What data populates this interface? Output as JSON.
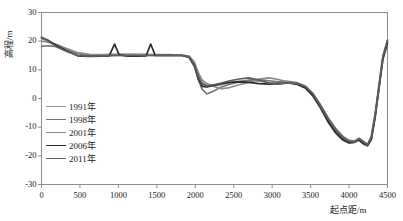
{
  "chart_data": {
    "type": "line",
    "title": "",
    "xlabel": "起点距/m",
    "ylabel": "高程/m",
    "xlim": [
      0,
      4500
    ],
    "ylim": [
      -30,
      30
    ],
    "xticks": [
      0,
      500,
      1000,
      1500,
      2000,
      2500,
      3000,
      3500,
      4000,
      4500
    ],
    "yticks": [
      30,
      20,
      10,
      0,
      -10,
      -20,
      -30
    ],
    "grid": false,
    "legend_position": "inside-left",
    "series": [
      {
        "name": "1991年",
        "color": "#9a9a9a",
        "width": 1.6,
        "x": [
          0,
          80,
          200,
          330,
          470,
          620,
          780,
          950,
          1120,
          1300,
          1480,
          1660,
          1830,
          1920,
          1990,
          2040,
          2090,
          2150,
          2240,
          2340,
          2450,
          2570,
          2700,
          2830,
          2960,
          3080,
          3200,
          3320,
          3430,
          3530,
          3630,
          3730,
          3830,
          3920,
          4000,
          4070,
          4130,
          4190,
          4240,
          4290,
          4340,
          4390,
          4440,
          4500
        ],
        "y": [
          20.8,
          20.0,
          18.6,
          17.2,
          15.9,
          15.3,
          15.2,
          15.3,
          15.4,
          15.3,
          15.2,
          15.2,
          15.1,
          14.6,
          12.0,
          8.0,
          5.6,
          4.6,
          4.4,
          4.8,
          5.6,
          6.1,
          6.2,
          6.0,
          5.6,
          5.4,
          5.6,
          5.2,
          4.0,
          1.2,
          -3.0,
          -7.8,
          -11.6,
          -14.0,
          -15.2,
          -15.0,
          -14.2,
          -15.6,
          -16.3,
          -14.0,
          -6.0,
          4.0,
          14.0,
          19.6
        ]
      },
      {
        "name": "1998年",
        "color": "#757575",
        "width": 1.6,
        "x": [
          0,
          80,
          200,
          330,
          470,
          620,
          780,
          950,
          1120,
          1300,
          1480,
          1660,
          1830,
          1920,
          1990,
          2040,
          2090,
          2150,
          2240,
          2340,
          2450,
          2570,
          2700,
          2830,
          2960,
          3080,
          3200,
          3320,
          3430,
          3530,
          3630,
          3730,
          3830,
          3920,
          4000,
          4070,
          4130,
          4190,
          4240,
          4290,
          4340,
          4390,
          4440,
          4500
        ],
        "y": [
          18.2,
          18.4,
          18.1,
          17.0,
          15.6,
          15.0,
          14.9,
          15.0,
          15.1,
          15.1,
          15.0,
          15.1,
          15.0,
          14.3,
          11.0,
          6.4,
          3.2,
          1.6,
          2.6,
          4.0,
          5.0,
          5.8,
          6.4,
          6.6,
          6.2,
          5.8,
          6.0,
          5.6,
          4.4,
          1.8,
          -2.2,
          -6.8,
          -10.6,
          -13.2,
          -14.6,
          -14.8,
          -13.8,
          -15.0,
          -16.0,
          -13.0,
          -5.0,
          5.0,
          15.0,
          20.2
        ]
      },
      {
        "name": "2001年",
        "color": "#8a8a8a",
        "width": 1.6,
        "x": [
          0,
          80,
          200,
          330,
          470,
          620,
          780,
          950,
          1120,
          1300,
          1480,
          1660,
          1830,
          1920,
          1990,
          2040,
          2090,
          2150,
          2240,
          2340,
          2450,
          2570,
          2700,
          2830,
          2960,
          3080,
          3200,
          3320,
          3430,
          3530,
          3630,
          3730,
          3830,
          3920,
          4000,
          4070,
          4130,
          4190,
          4240,
          4290,
          4340,
          4390,
          4440,
          4500
        ],
        "y": [
          20.0,
          19.6,
          18.8,
          17.4,
          16.0,
          15.4,
          15.3,
          15.4,
          15.4,
          15.4,
          15.3,
          15.3,
          15.2,
          14.8,
          12.6,
          9.0,
          6.4,
          5.2,
          4.2,
          3.4,
          3.8,
          4.8,
          5.6,
          6.8,
          7.2,
          6.6,
          5.8,
          5.0,
          3.6,
          0.8,
          -3.4,
          -8.4,
          -12.2,
          -14.6,
          -15.6,
          -15.4,
          -14.6,
          -16.0,
          -16.6,
          -14.4,
          -6.6,
          3.4,
          13.6,
          19.0
        ]
      },
      {
        "name": "2006年",
        "color": "#2b2b2b",
        "width": 1.7,
        "x": [
          0,
          80,
          200,
          330,
          470,
          620,
          780,
          880,
          950,
          1010,
          1120,
          1240,
          1360,
          1420,
          1480,
          1540,
          1660,
          1830,
          1920,
          1990,
          2040,
          2090,
          2150,
          2240,
          2340,
          2450,
          2570,
          2700,
          2830,
          2960,
          3080,
          3200,
          3320,
          3430,
          3530,
          3630,
          3730,
          3830,
          3920,
          4000,
          4070,
          4130,
          4190,
          4240,
          4290,
          4340,
          4390,
          4440,
          4500
        ],
        "y": [
          21.2,
          20.4,
          18.4,
          16.6,
          14.9,
          14.7,
          14.8,
          14.9,
          19.0,
          15.2,
          14.8,
          14.8,
          14.9,
          19.0,
          15.0,
          15.0,
          15.0,
          15.0,
          14.4,
          11.4,
          7.0,
          4.2,
          4.0,
          4.6,
          5.2,
          5.6,
          5.8,
          5.6,
          5.2,
          5.0,
          5.2,
          5.4,
          5.0,
          3.8,
          1.0,
          -3.2,
          -8.2,
          -12.0,
          -14.4,
          -15.4,
          -15.2,
          -14.4,
          -15.8,
          -16.4,
          -14.2,
          -6.2,
          3.8,
          13.8,
          19.4
        ]
      },
      {
        "name": "2011年",
        "color": "#5e5e5e",
        "width": 1.7,
        "x": [
          0,
          80,
          200,
          330,
          470,
          620,
          780,
          950,
          1120,
          1300,
          1480,
          1660,
          1830,
          1920,
          1990,
          2040,
          2090,
          2150,
          2240,
          2340,
          2450,
          2570,
          2700,
          2830,
          2960,
          3080,
          3200,
          3320,
          3430,
          3530,
          3630,
          3730,
          3830,
          3920,
          4000,
          4070,
          4130,
          4190,
          4240,
          4290,
          4340,
          4390,
          4440,
          4500
        ],
        "y": [
          21.4,
          20.2,
          18.0,
          16.4,
          15.0,
          14.8,
          14.9,
          15.0,
          15.0,
          15.0,
          15.0,
          15.1,
          15.0,
          14.5,
          11.8,
          7.6,
          5.0,
          4.4,
          4.8,
          5.4,
          6.2,
          6.8,
          7.2,
          6.4,
          5.4,
          5.0,
          5.4,
          5.2,
          4.2,
          1.6,
          -2.6,
          -7.2,
          -11.0,
          -13.6,
          -15.0,
          -15.2,
          -14.0,
          -15.2,
          -16.2,
          -13.6,
          -5.6,
          4.4,
          14.4,
          20.4
        ]
      }
    ]
  },
  "legend": {
    "items": [
      {
        "label": "1991年"
      },
      {
        "label": "1998年"
      },
      {
        "label": "2001年"
      },
      {
        "label": "2006年"
      },
      {
        "label": "2011年"
      }
    ]
  },
  "axes": {
    "ylabel": "高程/m",
    "xlabel": "起点距/m",
    "ytick_labels": [
      "30",
      "20",
      "10",
      "0",
      "-10",
      "-20",
      "-30"
    ],
    "xtick_labels": [
      "0",
      "500",
      "1000",
      "1500",
      "2000",
      "2500",
      "3000",
      "3500",
      "4000",
      "4500"
    ]
  }
}
